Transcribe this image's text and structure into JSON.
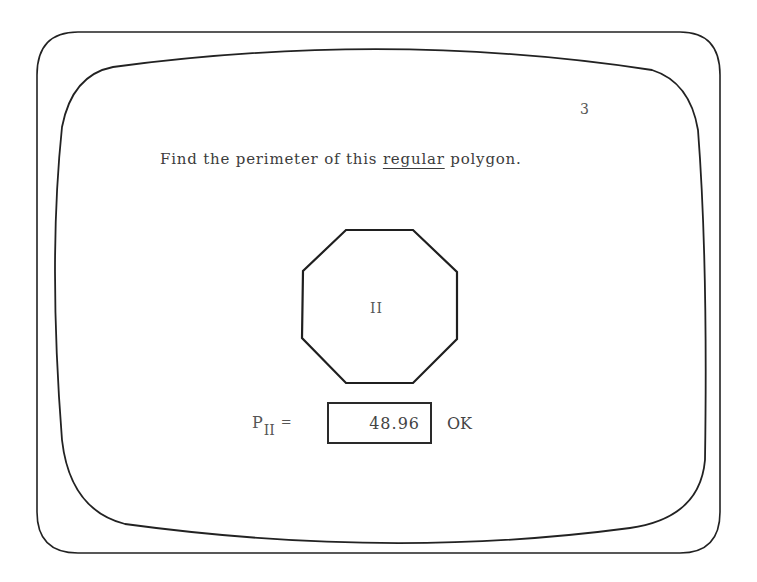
{
  "screen": {
    "page_number": "3",
    "question": {
      "prefix": "Find the perimeter of this",
      "emphasis": "regular",
      "suffix": "polygon."
    },
    "polygon": {
      "shape": "regular-octagon",
      "label": "II"
    },
    "answer": {
      "variable": "P",
      "subscript": "II",
      "equals": "=",
      "value": "48.96",
      "feedback": "OK"
    }
  },
  "colors": {
    "line": "#222222",
    "text": "#3c3c3c",
    "background": "#ffffff"
  }
}
